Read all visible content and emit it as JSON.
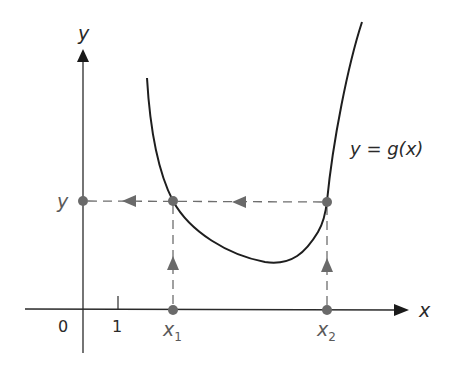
{
  "diagram": {
    "title": "",
    "type": "function-graph-level-set",
    "axes": {
      "x_label": "x",
      "y_label": "y",
      "origin_label": "0",
      "tick_label": "1"
    },
    "curve": {
      "label": "y = g(x)",
      "label_parts": {
        "lhs": "y",
        "eq": " = ",
        "rhs": "g(x)"
      },
      "color": "#1e1e1e"
    },
    "level": {
      "y_label": "y",
      "points": [
        {
          "id": "x1",
          "label": "x",
          "subscript": "1"
        },
        {
          "id": "x2",
          "label": "x",
          "subscript": "2"
        }
      ]
    },
    "colors": {
      "axis": "#2a2a2a",
      "dashed": "#6e6e6e",
      "points": "#6a6a6a",
      "curve": "#1e1e1e"
    }
  }
}
